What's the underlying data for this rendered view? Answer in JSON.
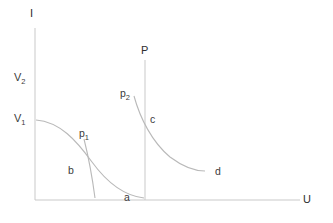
{
  "figure": {
    "type": "line-diagram",
    "background_color": "#ffffff",
    "curve_color": "#b9b9b9",
    "axis_color": "#c9c9c9",
    "text_color": "#3b3b3b",
    "width": 333,
    "height": 223
  },
  "axes": {
    "y_label": "I",
    "x_label": "U",
    "origin": {
      "x": 35,
      "y": 200
    },
    "y_top": 28,
    "x_right": 300
  },
  "tick_labels": [
    {
      "text": "V",
      "sub": "2",
      "x": 14,
      "y": 72
    },
    {
      "text": "V",
      "sub": "1",
      "x": 14,
      "y": 113
    }
  ],
  "annotations": [
    {
      "name": "p1",
      "text": "p",
      "sub": "1",
      "x": 79,
      "y": 128
    },
    {
      "name": "p2",
      "text": "p",
      "sub": "2",
      "x": 120,
      "y": 88
    },
    {
      "name": "b",
      "text": "b",
      "sub": "",
      "x": 68,
      "y": 165
    },
    {
      "name": "a",
      "text": "a",
      "sub": "",
      "x": 124,
      "y": 192
    },
    {
      "name": "c",
      "text": "c",
      "sub": "",
      "x": 150,
      "y": 114
    },
    {
      "name": "d",
      "text": "d",
      "sub": "",
      "x": 215,
      "y": 166
    },
    {
      "name": "P",
      "text": "P",
      "sub": "",
      "x": 141,
      "y": 45
    }
  ],
  "vertical_line_P": {
    "x": 145,
    "y_top": 60,
    "y_bottom": 200
  },
  "chart_data": {
    "type": "line",
    "title": "",
    "xlabel": "U",
    "ylabel": "I",
    "grid": false,
    "legend": "none",
    "series": [
      {
        "name": "b",
        "path": "M 36 120 C 60 122 76 140 92 162 C 108 184 126 196 144 198",
        "description": "left decaying curve from V1 on I-axis toward point a on U-axis"
      },
      {
        "name": "p1-steep",
        "path": "M 84 139 C 88 155 92 175 95 198",
        "description": "steep short line descending from p1 to the U-axis"
      },
      {
        "name": "c-d",
        "path": "M 134 96 C 140 118 152 142 170 157 C 186 169 196 171 205 171",
        "description": "right decaying curve from p2 through c flattening toward d"
      }
    ],
    "markers": [
      "V2",
      "V1",
      "p1",
      "p2",
      "a",
      "b",
      "c",
      "d",
      "P"
    ]
  }
}
